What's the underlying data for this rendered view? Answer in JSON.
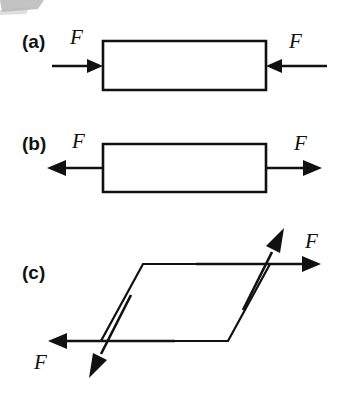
{
  "figure": {
    "width": 349,
    "height": 406,
    "background_color": "#ffffff",
    "ink_color": "#111111",
    "smudge_color": "#b9b9b9",
    "panels": [
      {
        "id": "a",
        "label": "(a)",
        "label_x": 22,
        "label_y": 48,
        "loading_type": "compression",
        "shape": "rectangle",
        "shape_points": "103,41 266,41 266,90 103,90",
        "forces": [
          {
            "name": "left-compression-force",
            "label": "F",
            "label_x": 70,
            "label_y": 44,
            "direction": "right",
            "shaft_from_x": 52,
            "shaft_from_y": 66,
            "shaft_to_x": 103,
            "shaft_to_y": 66
          },
          {
            "name": "right-compression-force",
            "label": "F",
            "label_x": 289,
            "label_y": 48,
            "direction": "left",
            "shaft_from_x": 327,
            "shaft_from_y": 66,
            "shaft_to_x": 266,
            "shaft_to_y": 66
          }
        ]
      },
      {
        "id": "b",
        "label": "(b)",
        "label_x": 22,
        "label_y": 150,
        "loading_type": "tension",
        "shape": "rectangle",
        "shape_points": "103,144 266,144 266,192 103,192",
        "forces": [
          {
            "name": "left-tension-force",
            "label": "F",
            "label_x": 72,
            "label_y": 148,
            "direction": "left",
            "shaft_from_x": 103,
            "shaft_from_y": 168,
            "shaft_to_x": 47,
            "shaft_to_y": 168
          },
          {
            "name": "right-tension-force",
            "label": "F",
            "label_x": 294,
            "label_y": 150,
            "direction": "right",
            "shaft_from_x": 266,
            "shaft_from_y": 168,
            "shaft_to_x": 322,
            "shaft_to_y": 168
          }
        ]
      },
      {
        "id": "c",
        "label": "(c)",
        "label_x": 22,
        "label_y": 279,
        "loading_type": "shear",
        "shape": "parallelogram",
        "shape_points": "143,264 270,264 228,341 101,341",
        "forces": [
          {
            "name": "upper-shear-force",
            "label": "F",
            "label_x": 305,
            "label_y": 248,
            "direction": "right",
            "shaft_from_x": 196,
            "shaft_from_y": 264,
            "shaft_to_x": 321,
            "shaft_to_y": 264
          },
          {
            "name": "lower-shear-force",
            "label": "F",
            "label_x": 34,
            "label_y": 369,
            "direction": "left",
            "shaft_from_x": 175,
            "shaft_from_y": 341,
            "shaft_to_x": 48,
            "shaft_to_y": 341
          },
          {
            "name": "diagonal-up-shear-force",
            "label": "",
            "direction": "up-right",
            "shaft_from_x": 243,
            "shaft_from_y": 310,
            "shaft_to_x": 284,
            "shaft_to_y": 228
          },
          {
            "name": "diagonal-down-shear-force",
            "label": "",
            "direction": "down-left",
            "shaft_from_x": 131,
            "shaft_from_y": 295,
            "shaft_to_x": 89,
            "shaft_to_y": 378
          }
        ]
      }
    ]
  }
}
